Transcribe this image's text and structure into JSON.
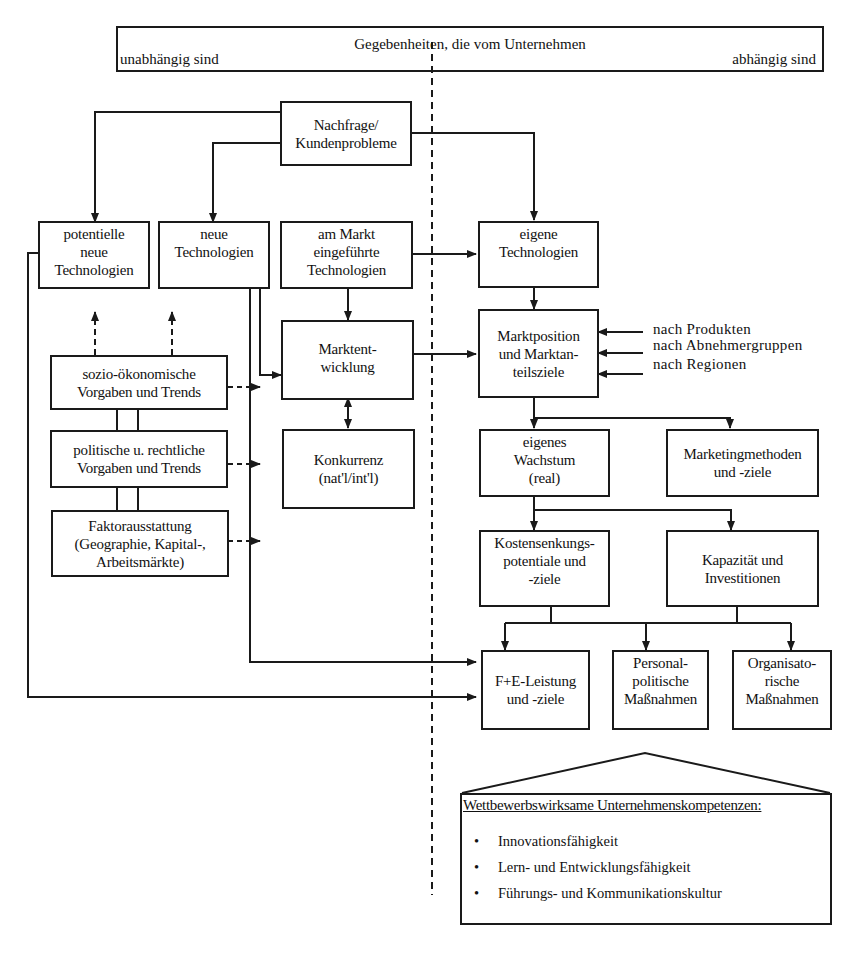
{
  "header": {
    "title": "Gegebenheiten, die vom Unternehmen",
    "left_label": "unabhängig sind",
    "right_label": "abhängig sind"
  },
  "nodes": {
    "nachfrage": [
      "Nachfrage/",
      "Kundenprobleme"
    ],
    "potentielle": [
      "potentielle",
      "neue",
      "Technologien"
    ],
    "neue_tech": [
      "neue",
      "Technologien"
    ],
    "am_markt": [
      "am Markt",
      "eingeführte",
      "Technologien"
    ],
    "eigene_tech": [
      "eigene",
      "Technologien"
    ],
    "sozio": [
      "sozio-ökonomische",
      "Vorgaben und Trends"
    ],
    "politisch": [
      "politische u. rechtliche",
      "Vorgaben und Trends"
    ],
    "faktor": [
      "Faktorausstattung",
      "(Geographie, Kapital-,",
      "Arbeitsmärkte)"
    ],
    "marktentwicklung": [
      "Marktent-",
      "wicklung"
    ],
    "konkurrenz": [
      "Konkurrenz",
      "(nat'l/int'l)"
    ],
    "marktposition": [
      "Marktposition",
      "und Marktan-",
      "teilsziele"
    ],
    "wachstum": [
      "eigenes",
      "Wachstum",
      "(real)"
    ],
    "marketing": [
      "Marketingmethoden",
      "und -ziele"
    ],
    "kosten": [
      "Kostensenkungs-",
      "potentiale und",
      "-ziele"
    ],
    "kapazitaet": [
      "Kapazität und",
      "Investitionen"
    ],
    "fue": [
      "F+E-Leistung",
      "und -ziele"
    ],
    "personal": [
      "Personal-",
      "politische",
      "Maßnahmen"
    ],
    "organisation": [
      "Organisato-",
      "rische",
      "Maßnahmen"
    ]
  },
  "marktposition_inputs": [
    "nach Produkten",
    "nach Abnehmergruppen",
    "nach Regionen"
  ],
  "competencies": {
    "title": "Wettbewerbswirksame Unternehmenskompetenzen:",
    "items": [
      "Innovationsfähigkeit",
      "Lern- und Entwicklungsfähigkeit",
      "Führungs- und Kommunikationskultur"
    ],
    "bullet": "•"
  },
  "colors": {
    "line": "#1a1a1a",
    "background": "#ffffff"
  }
}
